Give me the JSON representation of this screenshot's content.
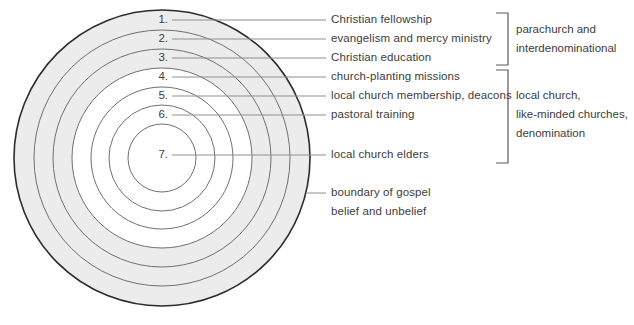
{
  "diagram": {
    "colors": {
      "ring_shaded": "#ececec",
      "ring_white": "#ffffff",
      "outline_outer": "#2b2b2b",
      "outline_inner": "#6b6b6b",
      "leader_line": "#8a8a8a",
      "bracket": "#5a5a5a",
      "text": "#3d3d3d"
    },
    "rings": [
      {
        "number": "1.",
        "label": "Christian fellowship",
        "shaded": true
      },
      {
        "number": "2.",
        "label": "evangelism and mercy ministry",
        "shaded": true
      },
      {
        "number": "3.",
        "label": "Christian education",
        "shaded": true
      },
      {
        "number": "4.",
        "label": "church-planting missions",
        "shaded": false
      },
      {
        "number": "5.",
        "label": "local church membership, deacons",
        "shaded": false
      },
      {
        "number": "6.",
        "label": "pastoral training",
        "shaded": false
      },
      {
        "number": "7.",
        "label": "local church elders",
        "shaded": false
      }
    ],
    "boundary_note": {
      "line1": "boundary of gospel",
      "line2": "belief and unbelief"
    },
    "groups": [
      {
        "name": "parachurch-group",
        "lines": [
          "parachurch and",
          "interdenominational"
        ],
        "covers": [
          "1.",
          "2.",
          "3."
        ]
      },
      {
        "name": "local-church-group",
        "lines": [
          "local church,",
          "like-minded churches,",
          "denomination"
        ],
        "covers": [
          "4.",
          "5.",
          "6.",
          "7."
        ]
      }
    ]
  }
}
